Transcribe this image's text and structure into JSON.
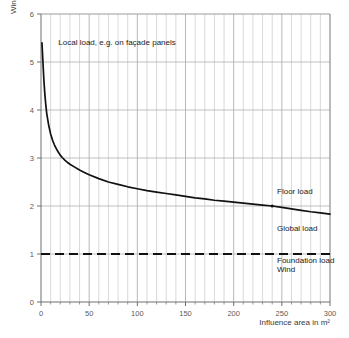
{
  "chart_data": {
    "type": "line",
    "title": "",
    "xlabel": "Influence area in m²",
    "ylabel": "Wind load  in kN/m²",
    "xlim": [
      0,
      300
    ],
    "ylim": [
      0,
      6
    ],
    "grid": true,
    "legend_position": "inline-annotations",
    "x_ticks": [
      "0",
      "50",
      "100",
      "150",
      "200",
      "250",
      "300"
    ],
    "x_tick_values": [
      0,
      50,
      100,
      150,
      200,
      250,
      300
    ],
    "y_ticks": [
      "0",
      "1",
      "2",
      "3",
      "4",
      "5",
      "6"
    ],
    "y_tick_values": [
      0,
      1,
      2,
      3,
      4,
      5,
      6
    ],
    "x_minor_step": 10,
    "series": [
      {
        "name": "Wind load curve",
        "style": "solid",
        "color": "#111111",
        "x": [
          1,
          2,
          3,
          4,
          5,
          6,
          8,
          10,
          12,
          14,
          16,
          18,
          20,
          22,
          25,
          28,
          30,
          35,
          40,
          45,
          50,
          60,
          70,
          80,
          90,
          100,
          110,
          120,
          130,
          140,
          150,
          160,
          170,
          180,
          190,
          200,
          210,
          220,
          230,
          240,
          250,
          260,
          270,
          280,
          290,
          300
        ],
        "y": [
          5.4,
          5.0,
          4.62,
          4.33,
          4.1,
          3.92,
          3.68,
          3.5,
          3.37,
          3.27,
          3.19,
          3.12,
          3.06,
          3.01,
          2.95,
          2.9,
          2.87,
          2.81,
          2.75,
          2.7,
          2.65,
          2.57,
          2.5,
          2.45,
          2.4,
          2.36,
          2.32,
          2.29,
          2.26,
          2.23,
          2.2,
          2.17,
          2.15,
          2.12,
          2.1,
          2.08,
          2.06,
          2.04,
          2.02,
          2.0,
          1.97,
          1.94,
          1.91,
          1.88,
          1.855,
          1.83
        ]
      },
      {
        "name": "Foundation load / Wind level",
        "style": "dashed",
        "color": "#111111",
        "x": [
          0,
          300
        ],
        "y": [
          1.0,
          1.0
        ]
      }
    ],
    "markers": [
      {
        "name": "floor-global-transition",
        "x": 240,
        "y": 2.0
      }
    ],
    "annotations": [
      {
        "name": "local-load",
        "text": "Local load, e.g. on façade panels",
        "x": 18,
        "y": 5.35,
        "anchor": "start"
      },
      {
        "name": "floor-load",
        "text": "Floor load",
        "x": 245,
        "y": 2.25,
        "anchor": "start"
      },
      {
        "name": "global-load",
        "text": "Global load",
        "x": 245,
        "y": 1.48,
        "anchor": "start"
      },
      {
        "name": "foundation-load",
        "text": "Foundation load",
        "x": 245,
        "y": 0.82,
        "anchor": "start"
      },
      {
        "name": "wind",
        "text": "Wind",
        "x": 245,
        "y": 0.62,
        "anchor": "start"
      }
    ],
    "colors": {
      "curve": "#111111",
      "dashed": "#111111",
      "grid_minor": "#c9c9c9",
      "grid_major": "#b0b0b0",
      "axis": "#6e6e6e",
      "text": "#3a3a3a"
    }
  },
  "axes": {
    "y_title": "Wind load  in kN/m²",
    "x_title": "Influence area in m²"
  },
  "annotations": {
    "local_load": "Local load, e.g. on façade panels",
    "floor_load": "Floor load",
    "global_load": "Global load",
    "foundation_load": "Foundation load",
    "wind": "Wind"
  },
  "x_tick_labels": [
    "0",
    "50",
    "100",
    "150",
    "200",
    "250",
    "300"
  ],
  "y_tick_labels": [
    "0",
    "1",
    "2",
    "3",
    "4",
    "5",
    "6"
  ]
}
